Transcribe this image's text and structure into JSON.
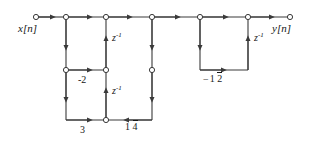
{
  "diagram": {
    "type": "signal-flow-graph",
    "input_label": "x[n]",
    "output_label": "y[n]",
    "delay_label_base": "z",
    "delay_label_exp": "-1",
    "stroke_color": "#3a3a3a",
    "node_fill": "#ffffff",
    "text_color": "#161616",
    "nodes": [
      {
        "id": "in",
        "x": 36,
        "y": 17,
        "name": "input-node"
      },
      {
        "id": "n1",
        "x": 66,
        "y": 17,
        "name": "top-node-1"
      },
      {
        "id": "n2",
        "x": 106,
        "y": 17,
        "name": "top-node-2"
      },
      {
        "id": "n3",
        "x": 152,
        "y": 17,
        "name": "top-node-3"
      },
      {
        "id": "n4",
        "x": 200,
        "y": 17,
        "name": "top-node-4"
      },
      {
        "id": "n5",
        "x": 248,
        "y": 17,
        "name": "top-node-5"
      },
      {
        "id": "out",
        "x": 290,
        "y": 17,
        "name": "output-node"
      },
      {
        "id": "m1",
        "x": 66,
        "y": 70,
        "name": "mid-node-left"
      },
      {
        "id": "m2",
        "x": 106,
        "y": 70,
        "name": "mid-node-right"
      },
      {
        "id": "m3",
        "x": 152,
        "y": 70,
        "name": "mid-node-feedback"
      },
      {
        "id": "b1",
        "x": 106,
        "y": 120,
        "name": "bottom-node-center"
      }
    ],
    "coefficients": [
      {
        "id": "c-2",
        "text": "-2",
        "name": "gain-minus-2",
        "x": 78,
        "y": 76
      },
      {
        "id": "c3",
        "text": "3",
        "name": "gain-3",
        "x": 80,
        "y": 126
      },
      {
        "id": "c-quart",
        "num": "1",
        "den": "4",
        "sign": "",
        "name": "gain-one-quarter",
        "x": 126,
        "y": 124
      },
      {
        "id": "c-half",
        "num": "1",
        "den": "2",
        "sign": "−",
        "name": "gain-minus-one-half",
        "x": 207,
        "y": 76
      }
    ],
    "delays": [
      {
        "id": "d1",
        "x": 112,
        "y": 37,
        "name": "delay-element-upper-left"
      },
      {
        "id": "d2",
        "x": 112,
        "y": 90,
        "name": "delay-element-lower-left"
      },
      {
        "id": "d3",
        "x": 254,
        "y": 37,
        "name": "delay-element-right"
      }
    ],
    "io_labels": [
      {
        "id": "xin",
        "x": 18,
        "y": 24,
        "name": "input-label"
      },
      {
        "id": "yout",
        "x": 272,
        "y": 24,
        "name": "output-label"
      }
    ]
  }
}
